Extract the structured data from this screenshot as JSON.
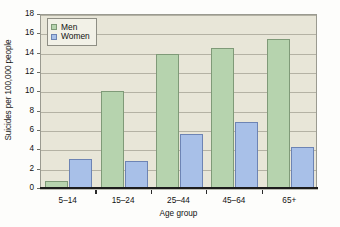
{
  "chart_data": {
    "type": "bar",
    "title": "",
    "xlabel": "Age group",
    "ylabel": "Suicides per 100,000 people",
    "categories": [
      "5–14",
      "15–24",
      "25–44",
      "45–64",
      "65+"
    ],
    "series": [
      {
        "name": "Men",
        "color": "#b6d3ae",
        "values": [
          0.7,
          10.0,
          13.9,
          14.5,
          15.4
        ]
      },
      {
        "name": "Women",
        "color": "#a8c0e8",
        "values": [
          3.0,
          2.8,
          5.6,
          6.8,
          4.2
        ]
      }
    ],
    "ylim": [
      0,
      18
    ],
    "ytick_step": 2,
    "yticks": [
      0,
      2,
      4,
      6,
      8,
      10,
      12,
      14,
      16,
      18
    ],
    "ytick_labels": [
      "0",
      "2",
      "4",
      "6",
      "8",
      "10",
      "12",
      "14",
      "16",
      "18"
    ],
    "grid": true,
    "grid_axis": "y",
    "legend_position": "top-left-inside",
    "plot_background": "#e8e6d8",
    "grid_color": "#b4b2a4",
    "axis_color": "#1c1c1c"
  }
}
